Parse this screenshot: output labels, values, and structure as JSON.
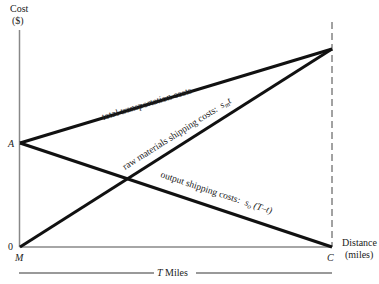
{
  "axes": {
    "y_label_line1": "Cost",
    "y_label_line2": "($)",
    "x_label_line1": "Distance",
    "x_label_line2": "(miles)",
    "origin_label": "0",
    "point_a": "A",
    "point_m": "M",
    "point_c": "C",
    "span_label": "T Miles"
  },
  "lines": {
    "total": "total transportation costs",
    "raw": "raw materials shipping costs:",
    "raw_formula": "s",
    "raw_sub": "m",
    "raw_var": "t",
    "output": "output shipping costs:",
    "output_formula": "s",
    "output_sub": "o",
    "output_var": "(T–t)"
  },
  "colors": {
    "line": "#111111",
    "axis": "#777777"
  }
}
